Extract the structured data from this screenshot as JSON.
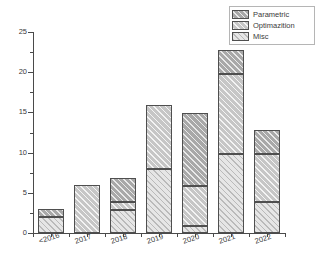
{
  "chart_data": {
    "type": "bar",
    "stacked": true,
    "title": "",
    "xlabel": "",
    "ylabel": "",
    "categories": [
      "<2016",
      "2017",
      "2018",
      "2019",
      "2020",
      "2021",
      "2022"
    ],
    "series": [
      {
        "name": "Misc",
        "values": [
          2.0,
          0.0,
          2.9,
          7.9,
          0.85,
          9.8,
          3.8
        ]
      },
      {
        "name": "Optimazition",
        "values": [
          0.0,
          6.0,
          1.0,
          8.0,
          5.0,
          10.0,
          6.0
        ]
      },
      {
        "name": "Parametric",
        "values": [
          1.0,
          0.0,
          3.0,
          0.0,
          9.1,
          2.9,
          3.0
        ]
      }
    ],
    "totals": [
      3.0,
      6.0,
      6.9,
      15.9,
      14.95,
      22.7,
      12.8
    ],
    "ylim": [
      0,
      25
    ],
    "ytick_labels": [
      "0",
      "5",
      "10",
      "15",
      "20",
      "25"
    ],
    "ytick_values": [
      0,
      5,
      10,
      15,
      20,
      25
    ],
    "yminor_values": [
      2.5,
      7.5,
      12.5,
      17.5,
      22.5
    ],
    "grid": false,
    "legend_position": "top-right",
    "legend_entries": [
      {
        "label": "Parametric",
        "color": "#a8a8a8",
        "pattern": "diagonal-hatch"
      },
      {
        "label": "Optimazition",
        "color": "#c6c6c6",
        "pattern": "diagonal-hatch"
      },
      {
        "label": "Misc",
        "color": "#e6e6e6",
        "pattern": "diagonal-hatch"
      }
    ]
  },
  "axis": {
    "y_ticks": [
      {
        "label": "25",
        "value": 25
      },
      {
        "label": "20",
        "value": 20
      },
      {
        "label": "15",
        "value": 15
      },
      {
        "label": "10",
        "value": 10
      },
      {
        "label": "5",
        "value": 5
      },
      {
        "label": "0",
        "value": 0
      }
    ]
  },
  "colors": {
    "parametric": "#a8a8a8",
    "optimization": "#c6c6c6",
    "misc": "#e6e6e6",
    "axis": "#4a4a4a",
    "text": "#3a3a3a",
    "background": "#ffffff"
  }
}
